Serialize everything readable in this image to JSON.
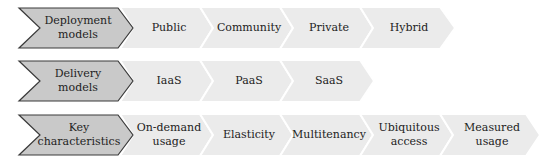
{
  "diagram": {
    "colors": {
      "header_fill": "#c9c9c9",
      "header_stroke": "#3a3a3a",
      "item_fill": "#ebebeb",
      "separator": "#ffffff",
      "text": "#222222"
    },
    "rows": [
      {
        "header": "Deployment\nmodels",
        "items": [
          "Public",
          "Community",
          "Private",
          "Hybrid"
        ]
      },
      {
        "header": "Delivery\nmodels",
        "items": [
          "IaaS",
          "PaaS",
          "SaaS"
        ]
      },
      {
        "header": "Key\ncharacteristics",
        "items": [
          "On-demand\nusage",
          "Elasticity",
          "Multitenancy",
          "Ubiquitous\naccess",
          "Measured\nusage"
        ]
      }
    ]
  }
}
